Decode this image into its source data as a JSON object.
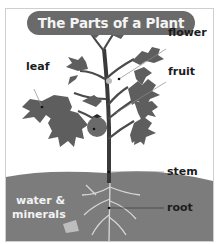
{
  "title": "The Parts of a Plant",
  "labels": {
    "leaf": "leaf",
    "flower": "flower",
    "fruit": "fruit",
    "stem": "stem",
    "root": "root",
    "water_line1": "water &",
    "water_line2": "minerals"
  },
  "colors": {
    "title_bg": "#6a6a6a",
    "title_text": "#f4f4f4",
    "soil": "#7c7c7c",
    "leaf": "#5e5e5e",
    "stem": "#3a3a3a",
    "border": "#cfcfcf"
  }
}
